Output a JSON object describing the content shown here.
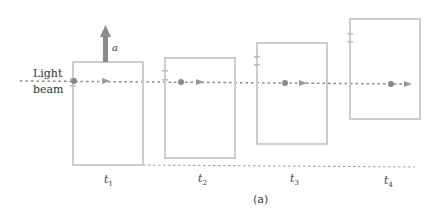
{
  "labels": {
    "light": "Light",
    "beam": "beam",
    "accel": "a",
    "caption": "(a)"
  },
  "times": [
    {
      "t": "t",
      "sub": "1"
    },
    {
      "t": "t",
      "sub": "2"
    },
    {
      "t": "t",
      "sub": "3"
    },
    {
      "t": "t",
      "sub": "4"
    }
  ],
  "colors": {
    "box": "#cccccc",
    "beam": "#888888",
    "arrow": "#8a8a8a"
  }
}
